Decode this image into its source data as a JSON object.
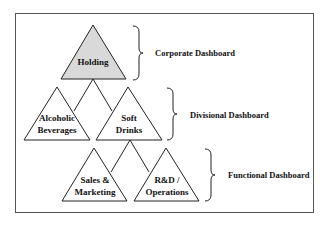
{
  "diagram": {
    "levels": [
      {
        "nodes": [
          "Holding"
        ],
        "label": "Corporate Dashboard"
      },
      {
        "nodes": [
          "Alcoholic Beverages",
          "Soft Drinks"
        ],
        "label": "Divisional Dashboard"
      },
      {
        "nodes": [
          "Sales & Marketing",
          "R&D / Operations"
        ],
        "label": "Functional Dashboard"
      }
    ],
    "holding": {
      "line1": "Holding"
    },
    "alcoholic": {
      "line1": "Alcoholic",
      "line2": "Beverages"
    },
    "soft": {
      "line1": "Soft",
      "line2": "Drinks"
    },
    "sales": {
      "line1": "Sales &",
      "line2": "Marketing"
    },
    "rnd": {
      "line1": "R&D /",
      "line2": "Operations"
    },
    "labels": {
      "corporate": "Corporate Dashboard",
      "divisional": "Divisional Dashboard",
      "functional": "Functional Dashboard"
    },
    "colors": {
      "holding_fill": "#d9d9d9",
      "stroke": "#222222",
      "frame": "#555555"
    }
  }
}
